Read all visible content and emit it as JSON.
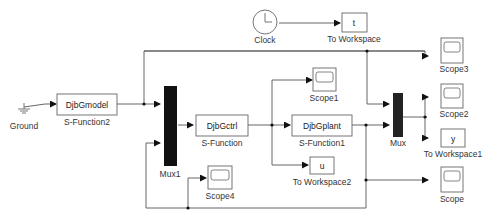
{
  "diagram": {
    "type": "simulink-model",
    "blocks": [
      {
        "id": "ground",
        "label": "Ground",
        "type": "ground",
        "icon": "ground-icon"
      },
      {
        "id": "sfun2",
        "label": "S-Function2",
        "text": "DjbGmodel",
        "type": "s-function"
      },
      {
        "id": "mux1",
        "label": "Mux1",
        "type": "mux"
      },
      {
        "id": "sfun",
        "label": "S-Function",
        "text": "DjbGctrl",
        "type": "s-function"
      },
      {
        "id": "sfun1",
        "label": "S-Function1",
        "text": "DjbGplant",
        "type": "s-function"
      },
      {
        "id": "scope1",
        "label": "Scope1",
        "type": "scope",
        "icon": "scope-icon"
      },
      {
        "id": "tows2",
        "label": "To Workspace2",
        "text": "u",
        "type": "to-workspace"
      },
      {
        "id": "scope4",
        "label": "Scope4",
        "type": "scope",
        "icon": "scope-icon"
      },
      {
        "id": "mux",
        "label": "Mux",
        "type": "mux"
      },
      {
        "id": "scope3",
        "label": "Scope3",
        "type": "scope",
        "icon": "scope-icon"
      },
      {
        "id": "scope2",
        "label": "Scope2",
        "type": "scope",
        "icon": "scope-icon"
      },
      {
        "id": "tows1",
        "label": "To Workspace1",
        "text": "y",
        "type": "to-workspace"
      },
      {
        "id": "scope",
        "label": "Scope",
        "type": "scope",
        "icon": "scope-icon"
      },
      {
        "id": "clock",
        "label": "Clock",
        "type": "clock",
        "icon": "clock-icon"
      },
      {
        "id": "tows",
        "label": "To Workspace",
        "text": "t",
        "type": "to-workspace"
      }
    ],
    "connections": [
      [
        "ground",
        "sfun2"
      ],
      [
        "sfun2",
        "mux1.in1"
      ],
      [
        "sfun2",
        "scope3"
      ],
      [
        "mux1",
        "sfun"
      ],
      [
        "sfun",
        "sfun1"
      ],
      [
        "sfun",
        "scope1"
      ],
      [
        "sfun",
        "tows2"
      ],
      [
        "sfun",
        "mux.in1"
      ],
      [
        "sfun1",
        "mux.in2"
      ],
      [
        "sfun1",
        "scope"
      ],
      [
        "sfun1",
        "mux1.in2"
      ],
      [
        "sfun1",
        "scope4"
      ],
      [
        "mux",
        "scope2"
      ],
      [
        "mux",
        "tows1"
      ],
      [
        "clock",
        "tows"
      ]
    ],
    "colors": {
      "line": "#555555",
      "block_border": "#666666",
      "mux_fill": "#111111"
    }
  }
}
